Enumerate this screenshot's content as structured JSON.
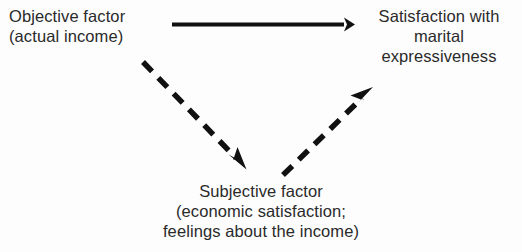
{
  "diagram": {
    "type": "path-diagram",
    "background_color": "#fdfdfd",
    "text_color": "#2a2a2a",
    "arrow_color": "#111111",
    "nodes": [
      {
        "id": "objective",
        "name": "objective-factor-node",
        "lines": [
          "Objective factor",
          "(actual income)"
        ],
        "align": "left"
      },
      {
        "id": "satisfaction",
        "name": "satisfaction-node",
        "lines": [
          "Satisfaction with",
          "marital",
          "expressiveness"
        ],
        "align": "center"
      },
      {
        "id": "subjective",
        "name": "subjective-factor-node",
        "lines": [
          "Subjective factor",
          "(economic satisfaction;",
          "feelings about the income)"
        ],
        "align": "center"
      }
    ],
    "arrows": [
      {
        "id": "objective-to-satisfaction",
        "name": "solid-arrow-objective-to-satisfaction",
        "style": "solid",
        "from": "objective",
        "to": "satisfaction",
        "x1": 172,
        "y1": 24,
        "x2": 347,
        "y2": 24
      },
      {
        "id": "objective-to-subjective",
        "name": "dashed-arrow-objective-to-subjective",
        "style": "dashed",
        "from": "objective",
        "to": "subjective",
        "x1": 143,
        "y1": 62,
        "x2": 240,
        "y2": 163
      },
      {
        "id": "subjective-to-satisfaction",
        "name": "dashed-arrow-subjective-to-satisfaction",
        "style": "dashed",
        "from": "subjective",
        "to": "satisfaction",
        "x1": 283,
        "y1": 175,
        "x2": 367,
        "y2": 93
      }
    ]
  }
}
